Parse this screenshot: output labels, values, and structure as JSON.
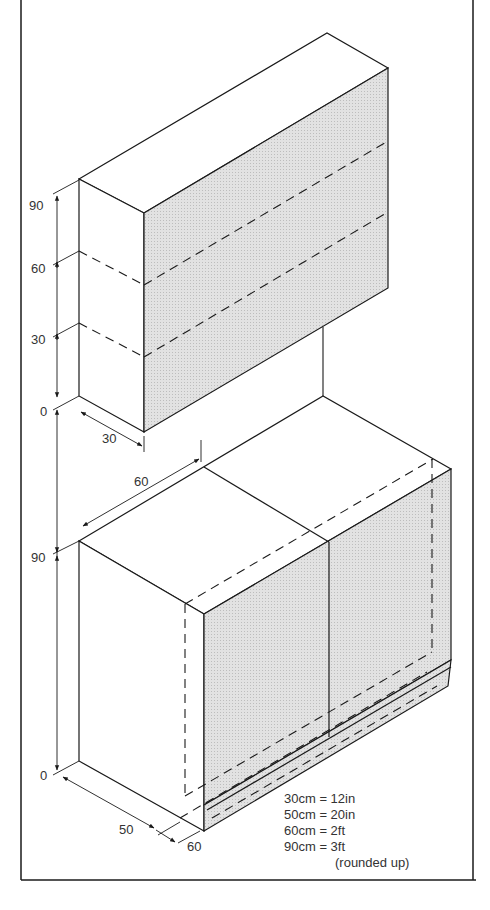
{
  "diagram": {
    "type": "isometric kitchen cabinet dimension drawing",
    "colors": {
      "line": "#1a1a1a",
      "shade": "#dcdcdc",
      "text": "#333333",
      "background": "#ffffff"
    },
    "wall_unit": {
      "height_ticks": [
        "90",
        "60",
        "30",
        "0"
      ],
      "depth_label": "30"
    },
    "base_unit": {
      "height_ticks": [
        "90",
        "0"
      ],
      "width_label": "60",
      "depth_label": "50",
      "plinth_label": "60"
    },
    "legend": {
      "lines": [
        "30cm = 12in",
        "50cm = 20in",
        "60cm = 2ft",
        "90cm = 3ft"
      ],
      "note": "(rounded up)"
    }
  }
}
